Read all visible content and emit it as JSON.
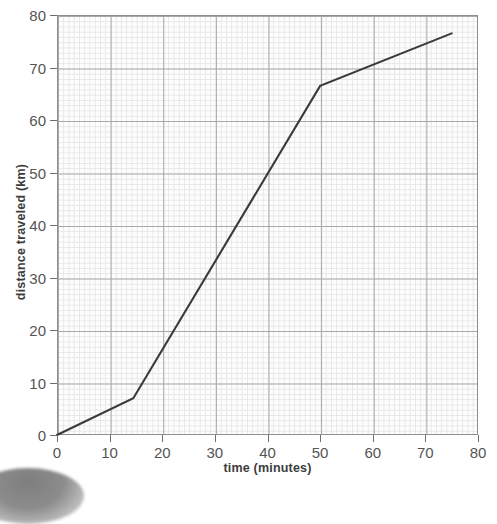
{
  "chart_data": {
    "type": "line",
    "title": "",
    "xlabel": "time (minutes)",
    "ylabel": "distance traveled (km)",
    "xlim": [
      0,
      80
    ],
    "ylim": [
      0,
      80
    ],
    "xticks": [
      0,
      10,
      20,
      30,
      40,
      50,
      60,
      70,
      80
    ],
    "yticks": [
      0,
      10,
      20,
      30,
      40,
      50,
      60,
      70,
      80
    ],
    "xtick_labels": [
      "0",
      "10",
      "20",
      "30",
      "40",
      "50",
      "60",
      "70",
      "80"
    ],
    "ytick_labels": [
      "0",
      "10",
      "20",
      "30",
      "40",
      "50",
      "60",
      "70",
      "80"
    ],
    "grid": true,
    "grid_style": "graph-paper: major gridlines every 10 units, minor gridlines every 1 unit",
    "legend": "none",
    "series": [
      {
        "name": "distance traveled",
        "color": "#3a3a3a",
        "line_width": 2,
        "x": [
          0,
          14.5,
          50,
          75
        ],
        "y": [
          0,
          7,
          66.5,
          76.5
        ],
        "points": [
          {
            "x": 0,
            "y": 0
          },
          {
            "x": 14.5,
            "y": 7
          },
          {
            "x": 50,
            "y": 66.5
          },
          {
            "x": 75,
            "y": 76.5
          }
        ],
        "segments": [
          {
            "from": [
              0,
              0
            ],
            "to": [
              14.5,
              7
            ],
            "slope_km_per_min": 0.48
          },
          {
            "from": [
              14.5,
              7
            ],
            "to": [
              50,
              66.5
            ],
            "slope_km_per_min": 1.68
          },
          {
            "from": [
              50,
              66.5
            ],
            "to": [
              75,
              76.5
            ],
            "slope_km_per_min": 0.4
          }
        ]
      }
    ]
  },
  "axes": {
    "x_title": "time (minutes)",
    "y_title": "distance traveled (km)"
  },
  "colors": {
    "line": "#3a3a3a",
    "major_grid": "#a8a8a8",
    "minor_grid": "#e6e6ea",
    "frame": "#8e8e8e",
    "tick_label": "#555555",
    "axis_title": "#3d3d3d",
    "background": "#ffffff",
    "plot_background": "#fdfdfd"
  }
}
